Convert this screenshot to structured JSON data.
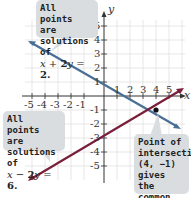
{
  "graph": {
    "x_axis_label": "x",
    "y_axis_label": "y",
    "x_ticks": [
      "-5",
      "-4",
      "-3",
      "-2",
      "-1",
      "1",
      "2",
      "3",
      "4",
      "5"
    ],
    "y_ticks": [
      "5",
      "4",
      "3",
      "2",
      "1",
      "-1",
      "-2",
      "-3",
      "-4",
      "-5"
    ],
    "lines": [
      {
        "equation": "x + 2y = 2",
        "color": "#4a6f96"
      },
      {
        "equation": "x - 2y = 6",
        "color": "#7a1f3a"
      }
    ],
    "intersection": {
      "x": 4,
      "y": -1
    }
  },
  "callouts": {
    "top": {
      "line1": "All points are",
      "line2": "solutions of",
      "eq_a": "x",
      "eq_op": " + ",
      "eq_b": "2",
      "eq_c": "y",
      "eq_d": " = ",
      "eq_e": "2."
    },
    "left": {
      "line1": "All points are",
      "line2": "solutions of",
      "eq_a": "x",
      "eq_op": " − ",
      "eq_b": "2",
      "eq_c": "y",
      "eq_d": " = ",
      "eq_e": "6."
    },
    "right": {
      "line1": "Point of",
      "line2": "intersection",
      "line3": "(4, −1) gives",
      "line4": "the common",
      "line5": "solution."
    }
  }
}
